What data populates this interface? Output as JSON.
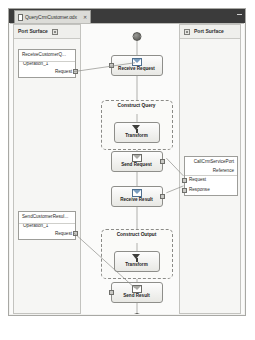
{
  "window": {
    "tab": {
      "label": "QueryCrmCustomer.odx",
      "doc_icon": "document-icon",
      "close_icon": "close-icon"
    },
    "minimize_icon": "minimize-icon"
  },
  "left_panel": {
    "title": "Port Surface",
    "chip_icon": "port-chip-icon",
    "ports": [
      {
        "name": "ReceiveCustomerQ...",
        "operation": "Operation_1",
        "message": "Request",
        "handle_icon": "port-handle-icon"
      },
      {
        "name": "SendCustomerResul...",
        "operation": "Operation_1",
        "message": "Request",
        "handle_icon": "port-handle-icon"
      }
    ]
  },
  "right_panel": {
    "title": "Port Surface",
    "chip_icon": "port-chip-icon",
    "ports": [
      {
        "name": "CallCrmServicePort",
        "operation": "Reference",
        "messages": [
          "Request",
          "Response"
        ],
        "handle_icon": "port-handle-icon"
      }
    ]
  },
  "orchestration": {
    "start_marker": "start-marker-icon",
    "end_marker": "end-marker-icon",
    "nodes": [
      {
        "id": "receive-request",
        "label": "Receive Request",
        "icon": "receive-envelope-icon"
      },
      {
        "id": "transform-query",
        "label": "Transform",
        "icon": "transform-funnel-icon"
      },
      {
        "id": "send-request",
        "label": "Send Request",
        "icon": "send-envelope-icon"
      },
      {
        "id": "receive-result",
        "label": "Receive Result",
        "icon": "receive-envelope-icon"
      },
      {
        "id": "transform-output",
        "label": "Transform",
        "icon": "transform-funnel-icon"
      },
      {
        "id": "send-result",
        "label": "Send Result",
        "icon": "send-envelope-icon"
      }
    ],
    "groups": [
      {
        "id": "construct-query",
        "label": "Construct Query"
      },
      {
        "id": "construct-output",
        "label": "Construct Output"
      }
    ]
  },
  "colors": {
    "titlebar": "#3b3b3b",
    "canvas": "#fbfbfa",
    "panel": "#f6f6f4",
    "border": "#8e8e8a",
    "envelope_accent": "#7a9ec0"
  }
}
